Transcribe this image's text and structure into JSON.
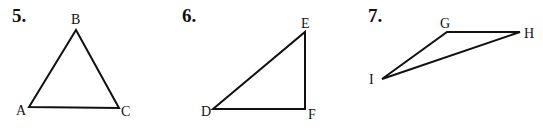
{
  "problems": [
    {
      "number": "5.",
      "number_pos": [
        12,
        22
      ],
      "vertices": [
        {
          "label": "A",
          "x": 29,
          "y": 107,
          "lx": 16,
          "ly": 115
        },
        {
          "label": "B",
          "x": 76,
          "y": 30,
          "lx": 71,
          "ly": 24
        },
        {
          "label": "C",
          "x": 119,
          "y": 108,
          "lx": 121,
          "ly": 116
        }
      ]
    },
    {
      "number": "6.",
      "number_pos": [
        182,
        22
      ],
      "vertices": [
        {
          "label": "D",
          "x": 213,
          "y": 109,
          "lx": 201,
          "ly": 116
        },
        {
          "label": "E",
          "x": 305,
          "y": 32,
          "lx": 301,
          "ly": 28
        },
        {
          "label": "F",
          "x": 305,
          "y": 109,
          "lx": 308,
          "ly": 119
        }
      ]
    },
    {
      "number": "7.",
      "number_pos": [
        368,
        22
      ],
      "vertices": [
        {
          "label": "G",
          "x": 447,
          "y": 32,
          "lx": 440,
          "ly": 28
        },
        {
          "label": "H",
          "x": 520,
          "y": 32,
          "lx": 524,
          "ly": 38
        },
        {
          "label": "I",
          "x": 382,
          "y": 79,
          "lx": 369,
          "ly": 84
        }
      ]
    }
  ]
}
